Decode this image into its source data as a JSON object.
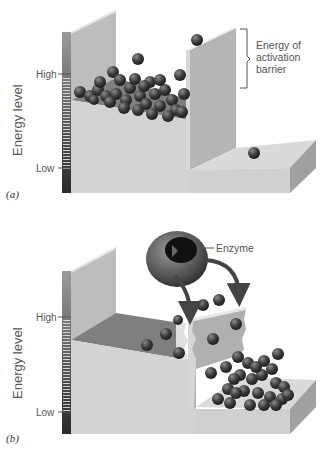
{
  "panels": [
    {
      "id": "a",
      "label": "(a)",
      "axis_label": "Energy level",
      "tick_high": "High",
      "tick_low": "Low",
      "annotation": [
        "Energy of",
        "activation",
        "barrier"
      ]
    },
    {
      "id": "b",
      "label": "(b)",
      "axis_label": "Energy level",
      "tick_high": "High",
      "tick_low": "Low",
      "annotation": [
        "Enzyme"
      ]
    }
  ],
  "colors": {
    "ball": "#3a3a3a",
    "wall_light": "#d2d2d2",
    "wall_mid": "#b8b8b8",
    "wall_dark": "#8e8e8e",
    "floor_dark": "#7a7a7a",
    "text": "#555555"
  }
}
